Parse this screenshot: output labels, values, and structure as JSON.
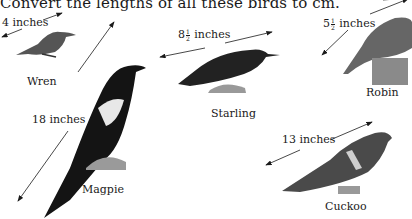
{
  "instruction": "Convert the lengths of all these birds to cm.",
  "birds": [
    {
      "name": "Wren",
      "length_label": "4 inches"
    },
    {
      "name": "Starling",
      "length_whole": "8",
      "length_num": "1",
      "length_den": "2",
      "length_unit": "inches"
    },
    {
      "name": "Robin",
      "length_whole": "5",
      "length_num": "1",
      "length_den": "2",
      "length_unit": "inches"
    },
    {
      "name": "Magpie",
      "length_label": "18 inches"
    },
    {
      "name": "Cuckoo",
      "length_label": "13 inches"
    }
  ]
}
